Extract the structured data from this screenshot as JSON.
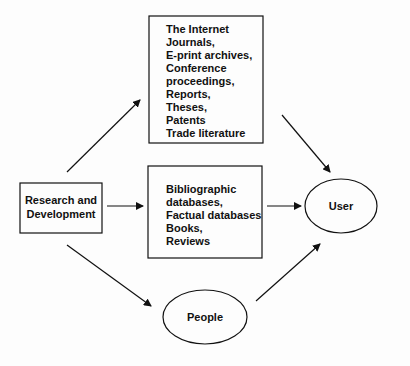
{
  "nodes": {
    "research": {
      "lines": [
        "Research and",
        "Development"
      ]
    },
    "sources_primary": {
      "lines": [
        "The Internet",
        "Journals,",
        "E-print archives,",
        "Conference",
        "proceedings,",
        "Reports,",
        "Theses,",
        "Patents",
        "Trade literature"
      ]
    },
    "sources_secondary": {
      "lines": [
        "Bibliographic",
        "databases,",
        "Factual databases",
        "Books,",
        "Reviews"
      ]
    },
    "people": {
      "label": "People"
    },
    "user": {
      "label": "User"
    }
  },
  "edges": [
    {
      "from": "research",
      "to": "sources_primary"
    },
    {
      "from": "research",
      "to": "sources_secondary"
    },
    {
      "from": "research",
      "to": "people"
    },
    {
      "from": "sources_primary",
      "to": "user"
    },
    {
      "from": "sources_secondary",
      "to": "user"
    },
    {
      "from": "people",
      "to": "user"
    }
  ],
  "colors": {
    "stroke": "#111111",
    "background": "#fdfdfd"
  }
}
